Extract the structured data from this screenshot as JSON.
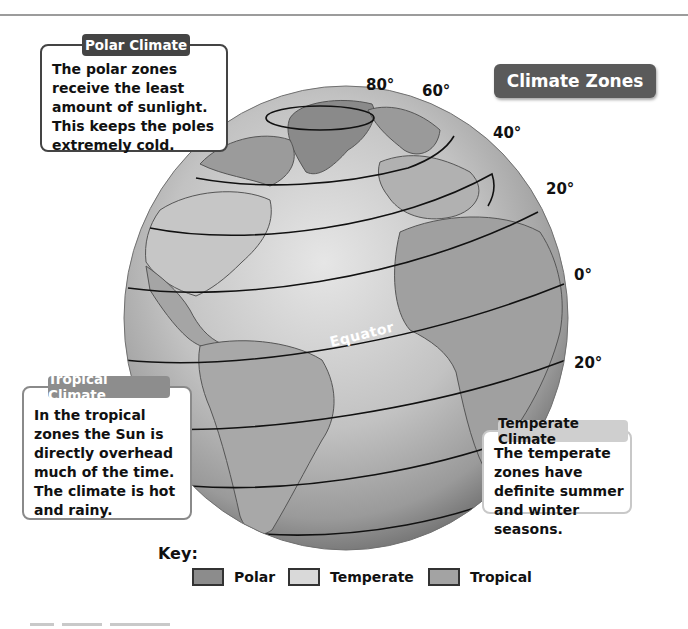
{
  "diagram": {
    "title": "Climate Zones",
    "latitude_labels": [
      "80°",
      "60°",
      "40°",
      "20°",
      "0°",
      "20°"
    ],
    "equator_label": "Equator",
    "callouts": {
      "polar": {
        "heading": "Polar Climate",
        "text": "The polar zones receive the least amount of sunlight. This keeps the poles extremely cold."
      },
      "tropical": {
        "heading": "Tropical Climate",
        "text": "In the tropical zones the Sun is directly overhead much of the time. The climate is hot and rainy."
      },
      "temperate": {
        "heading": "Temperate Climate",
        "text": "The temperate zones have definite summer and winter seasons."
      }
    },
    "key": {
      "title": "Key:",
      "items": [
        {
          "label": "Polar",
          "color": "#8c8c8c"
        },
        {
          "label": "Temperate",
          "color": "#d9d9d9"
        },
        {
          "label": "Tropical",
          "color": "#a3a3a3"
        }
      ]
    },
    "colors": {
      "ocean": "#bdbdbd",
      "land": "#a0a0a0",
      "polar_land": "#8a8a8a",
      "latitude_line": "#111111",
      "title_badge": "#5a5a5a"
    }
  }
}
